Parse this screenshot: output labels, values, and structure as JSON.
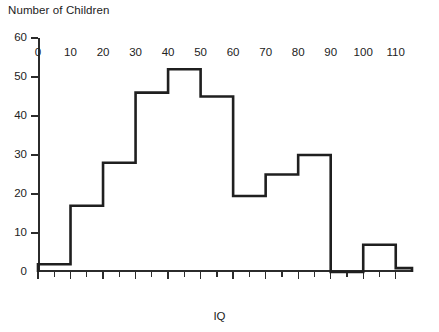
{
  "chart_data": {
    "type": "bar",
    "title": "",
    "ylabel": "Number of Children",
    "xlabel": "IQ",
    "bin_width": 10,
    "bin_edges": [
      0,
      10,
      20,
      30,
      40,
      50,
      60,
      70,
      80,
      90,
      100,
      110,
      115
    ],
    "categories": [
      "0-10",
      "10-20",
      "20-30",
      "30-40",
      "40-50",
      "50-60",
      "60-70",
      "70-80",
      "80-90",
      "90-100",
      "100-110",
      "110-115"
    ],
    "values": [
      2,
      17,
      28,
      46,
      52,
      45,
      19.5,
      25,
      30,
      0,
      7,
      1
    ],
    "xlim": [
      0,
      115
    ],
    "ylim": [
      0,
      60
    ],
    "ytick_labels": [
      "0",
      "10",
      "20",
      "30",
      "40",
      "50",
      "60"
    ],
    "ytick_values": [
      0,
      10,
      20,
      30,
      40,
      50,
      60
    ],
    "xtick_labels": [
      "0",
      "10",
      "20",
      "30",
      "40",
      "50",
      "60",
      "70",
      "80",
      "90",
      "100",
      "110"
    ],
    "xtick_values": [
      0,
      10,
      20,
      30,
      40,
      50,
      60,
      70,
      80,
      90,
      100,
      110
    ],
    "xminor_values": [
      5,
      15,
      25,
      35,
      45,
      55,
      65,
      75,
      85,
      95,
      105
    ],
    "grid": false,
    "legend": false,
    "line_color": "#1f1f1f",
    "axis_color": "#2b2b2b",
    "background": "#ffffff"
  }
}
